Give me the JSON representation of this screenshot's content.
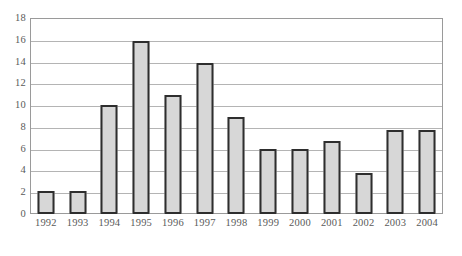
{
  "chart_data": {
    "type": "bar",
    "title": "",
    "subtitle": "",
    "xlabel": "",
    "ylabel": "",
    "categories": [
      "1992",
      "1993",
      "1994",
      "1995",
      "1996",
      "1997",
      "1998",
      "1999",
      "2000",
      "2001",
      "2002",
      "2003",
      "2004"
    ],
    "values": [
      2.1,
      2.1,
      10.0,
      15.9,
      10.9,
      13.9,
      8.9,
      6.0,
      6.0,
      6.7,
      3.8,
      7.7,
      7.7
    ],
    "ylim": [
      0,
      18
    ],
    "ytick_step": 2,
    "yticks": [
      "0",
      "2",
      "4",
      "6",
      "8",
      "10",
      "12",
      "14",
      "16",
      "18"
    ],
    "ytick_values": [
      0,
      2,
      4,
      6,
      8,
      10,
      12,
      14,
      16,
      18
    ],
    "grid": true,
    "grid_axis": "y",
    "legend": false,
    "legend_position": "none",
    "bar_fill_color": "#d7d7d7",
    "bar_border_color": "#2e2e2e",
    "grid_color": "#b4b4b4",
    "frame_color": "#9a9a9a",
    "tick_label_color": "#5a5a5a",
    "background_color": "#ffffff"
  },
  "caption": {
    "text": "",
    "visible": false
  }
}
